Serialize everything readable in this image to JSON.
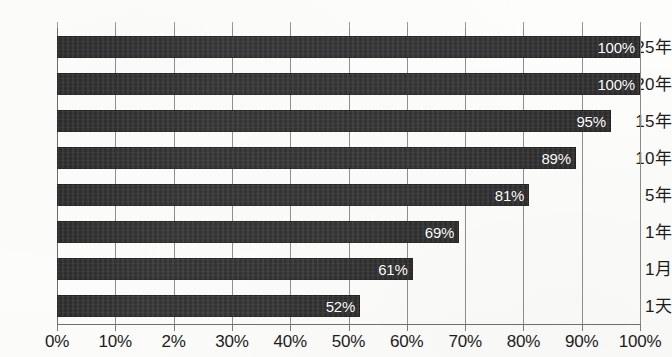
{
  "chart_data": {
    "type": "bar",
    "orientation": "horizontal",
    "title": "",
    "subtitle": "",
    "xlabel": "",
    "ylabel": "",
    "categories": [
      "25年",
      "20年",
      "15年",
      "10年",
      "5年",
      "1年",
      "1月",
      "1天"
    ],
    "values": [
      100,
      100,
      95,
      89,
      81,
      69,
      61,
      52
    ],
    "data_labels": [
      "100%",
      "100%",
      "95%",
      "89%",
      "81%",
      "69%",
      "61%",
      "52%"
    ],
    "xlim": [
      0,
      100
    ],
    "x_tick_values": [
      0,
      10,
      20,
      30,
      40,
      50,
      60,
      70,
      80,
      90,
      100
    ],
    "x_tick_labels": [
      "0%",
      "10%",
      "2%",
      "30%",
      "40%",
      "50%",
      "60%",
      "70%",
      "80%",
      "90%",
      "100%"
    ],
    "grid": "vertical",
    "legend": "none",
    "bar_color": "#2b2b2b",
    "data_label_color": "#ffffff",
    "gridline_color": "#8e8e8e",
    "background_color": "#fdfdfb"
  }
}
